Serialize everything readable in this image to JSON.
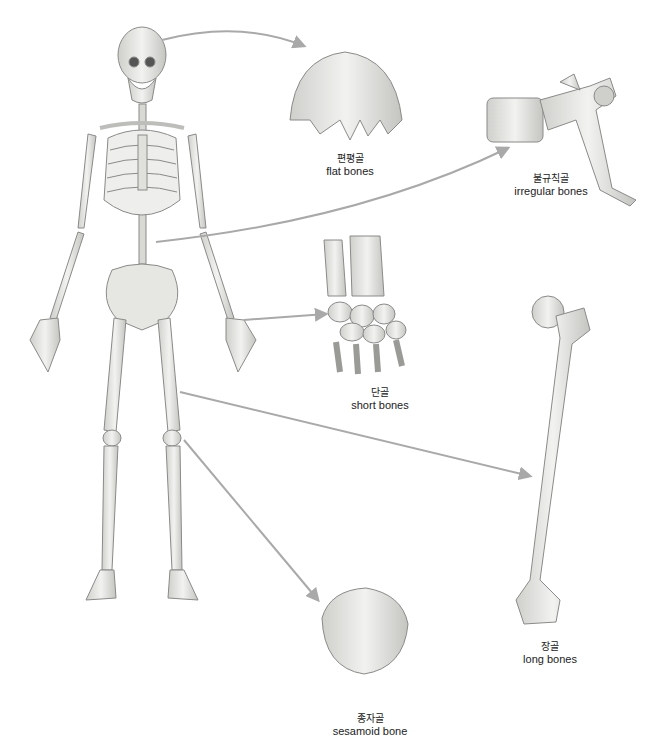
{
  "diagram": {
    "categories": [
      {
        "id": "flat",
        "ko": "편평골",
        "en": "flat bones"
      },
      {
        "id": "irregular",
        "ko": "불규칙골",
        "en": "irregular bones"
      },
      {
        "id": "short",
        "ko": "단골",
        "en": "short bones"
      },
      {
        "id": "long",
        "ko": "장골",
        "en": "long bones"
      },
      {
        "id": "sesamoid",
        "ko": "종자골",
        "en": "sesamoid bone"
      }
    ],
    "colors": {
      "bone_fill": "#e8e8e6",
      "bone_stroke": "#8a8a88",
      "arrow": "#a9a9a9",
      "shadow": "#b8b8b5"
    }
  }
}
